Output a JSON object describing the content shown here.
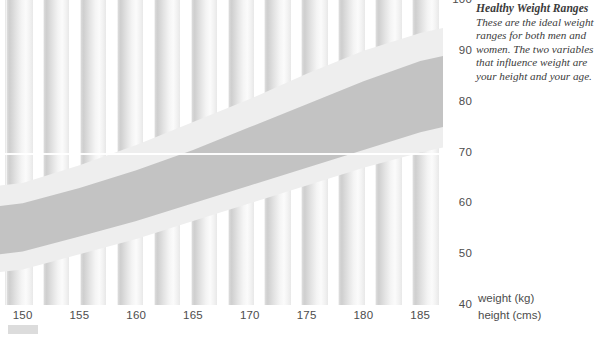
{
  "chart_data": {
    "type": "area",
    "title": "Healthy Weight Ranges",
    "xlabel": "height (cms)",
    "ylabel": "weight (kg)",
    "xlim": [
      148,
      187
    ],
    "ylim": [
      40,
      100
    ],
    "grid": true,
    "gridlines_y": [
      70
    ],
    "legend": "none",
    "x_ticks": [
      "150",
      "155",
      "160",
      "165",
      "170",
      "175",
      "180",
      "185"
    ],
    "x_tick_values": [
      150,
      155,
      160,
      165,
      170,
      175,
      180,
      185
    ],
    "y_ticks": [
      "40",
      "50",
      "60",
      "70",
      "80",
      "90",
      "100"
    ],
    "y_tick_values": [
      40,
      50,
      60,
      70,
      80,
      90,
      100
    ],
    "series": [
      {
        "name": "acceptable range (outer band)",
        "color": "#eeeeee",
        "x": [
          148,
          150,
          155,
          160,
          165,
          170,
          175,
          180,
          185,
          187
        ],
        "upper": [
          63.5,
          64.0,
          67.5,
          71.5,
          76.0,
          80.5,
          85.5,
          90.0,
          93.5,
          94.5
        ],
        "lower": [
          46.5,
          47.0,
          50.0,
          53.0,
          56.5,
          60.0,
          63.5,
          67.0,
          70.0,
          71.0
        ]
      },
      {
        "name": "ideal range (inner band)",
        "color": "#c3c3c3",
        "x": [
          148,
          150,
          155,
          160,
          165,
          170,
          175,
          180,
          185,
          187
        ],
        "upper": [
          59.5,
          60.0,
          63.0,
          66.5,
          70.5,
          75.0,
          79.5,
          84.0,
          88.0,
          89.0
        ],
        "lower": [
          50.0,
          50.5,
          53.5,
          56.5,
          60.0,
          63.5,
          67.0,
          70.5,
          74.0,
          75.0
        ]
      }
    ]
  },
  "annotation": {
    "title": "Healthy Weight Ranges",
    "body": "These are the ideal weight ranges for both men and women. The two variables that influence weight are your height and your age."
  },
  "axes": {
    "x_unit_label": "height (cms)",
    "y_unit_label": "weight (kg)"
  },
  "colors": {
    "band_outer": "#eeeeee",
    "band_inner": "#c3c3c3",
    "column": "#d7d7d7",
    "gridline": "#ffffff",
    "text": "#4d4d4d",
    "annotation_text": "#3b3b3b",
    "legend_swatch": "#dcdcdc"
  },
  "background": {
    "column_count": 12
  }
}
